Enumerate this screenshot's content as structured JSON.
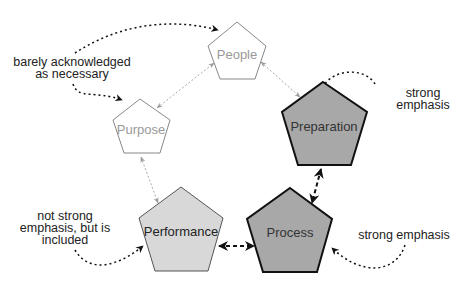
{
  "diagram": {
    "type": "pentagon-cycle",
    "nodes": [
      {
        "id": "people",
        "label": "People",
        "emphasis": "barely",
        "fill": "#ffffff",
        "stroke": "#888888",
        "text_color": "#999999"
      },
      {
        "id": "purpose",
        "label": "Purpose",
        "emphasis": "barely",
        "fill": "#ffffff",
        "stroke": "#888888",
        "text_color": "#999999"
      },
      {
        "id": "preparation",
        "label": "Preparation",
        "emphasis": "strong",
        "fill": "#a8a8a8",
        "stroke": "#111111",
        "text_color": "#333333"
      },
      {
        "id": "performance",
        "label": "Performance",
        "emphasis": "included",
        "fill": "#d8d8d8",
        "stroke": "#555555",
        "text_color": "#222222"
      },
      {
        "id": "process",
        "label": "Process",
        "emphasis": "strong",
        "fill": "#a8a8a8",
        "stroke": "#111111",
        "text_color": "#333333"
      }
    ],
    "edges": [
      {
        "from": "purpose",
        "to": "people",
        "style": "light-dotted-bidirectional"
      },
      {
        "from": "people",
        "to": "preparation",
        "style": "light-dotted-bidirectional"
      },
      {
        "from": "purpose",
        "to": "performance",
        "style": "light-dotted-bidirectional"
      },
      {
        "from": "performance",
        "to": "process",
        "style": "bold-dashed-bidirectional"
      },
      {
        "from": "preparation",
        "to": "process",
        "style": "bold-dashed-bidirectional"
      }
    ],
    "annotations": [
      {
        "id": "barely",
        "lines": [
          "barely acknowledged",
          "as necessary"
        ],
        "targets": [
          "people",
          "purpose"
        ]
      },
      {
        "id": "strong-prep",
        "lines": [
          "strong",
          "emphasis"
        ],
        "targets": [
          "preparation"
        ]
      },
      {
        "id": "not-strong",
        "lines": [
          "not strong",
          "emphasis, but is",
          "included"
        ],
        "targets": [
          "performance"
        ]
      },
      {
        "id": "strong-process",
        "lines": [
          "strong emphasis"
        ],
        "targets": [
          "process"
        ]
      }
    ]
  }
}
